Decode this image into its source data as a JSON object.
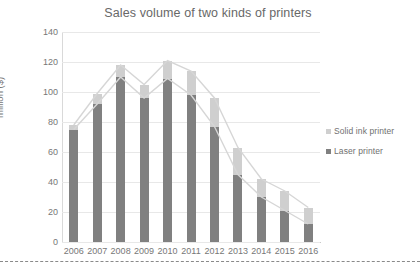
{
  "chart_data": {
    "type": "bar",
    "title": "Sales volume of two kinds of printers",
    "xlabel": "",
    "ylabel": "million ($)",
    "categories": [
      "2006",
      "2007",
      "2008",
      "2009",
      "2010",
      "2011",
      "2012",
      "2013",
      "2014",
      "2015",
      "2016"
    ],
    "ylim": [
      0,
      140
    ],
    "yticks": [
      0,
      20,
      40,
      60,
      80,
      100,
      120,
      140
    ],
    "grid": true,
    "stacked": true,
    "legend_position": "right",
    "series": [
      {
        "name": "Laser printer",
        "color": "#808080",
        "values": [
          75,
          92,
          110,
          96,
          109,
          98,
          77,
          45,
          30,
          21,
          12
        ]
      },
      {
        "name": "Solid ink printer",
        "color": "#cfcfcf",
        "values": [
          78,
          99,
          118,
          105,
          121,
          114,
          96,
          63,
          42,
          34,
          23
        ]
      }
    ]
  },
  "legend": {
    "items": [
      {
        "label": "Solid ink printer",
        "color": "#cfcfcf"
      },
      {
        "label": "Laser printer",
        "color": "#808080"
      }
    ]
  }
}
